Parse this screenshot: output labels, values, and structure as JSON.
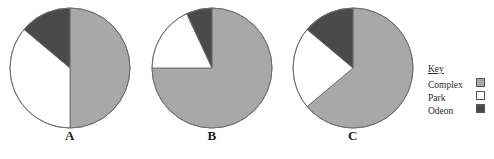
{
  "chart_data": {
    "type": "pie",
    "title": "",
    "legend_position": "right",
    "legend_title": "Key",
    "categories": [
      "Complex",
      "Park",
      "Odeon"
    ],
    "colors": [
      "#a8a8a8",
      "#ffffff",
      "#4a4a4a"
    ],
    "charts": [
      {
        "label": "A",
        "values": [
          50,
          36,
          14
        ],
        "slices": [
          {
            "name": "Complex",
            "percent": 50,
            "degrees": 180,
            "color": "#a8a8a8"
          },
          {
            "name": "Park",
            "percent": 36,
            "degrees": 130,
            "color": "#ffffff"
          },
          {
            "name": "Odeon",
            "percent": 14,
            "degrees": 50,
            "color": "#4a4a4a"
          }
        ]
      },
      {
        "label": "B",
        "values": [
          75,
          18,
          7
        ],
        "slices": [
          {
            "name": "Complex",
            "percent": 75,
            "degrees": 270,
            "color": "#a8a8a8"
          },
          {
            "name": "Park",
            "percent": 18,
            "degrees": 65,
            "color": "#ffffff"
          },
          {
            "name": "Odeon",
            "percent": 7,
            "degrees": 25,
            "color": "#4a4a4a"
          }
        ]
      },
      {
        "label": "C",
        "values": [
          64,
          22,
          14
        ],
        "slices": [
          {
            "name": "Complex",
            "percent": 64,
            "degrees": 230,
            "color": "#a8a8a8"
          },
          {
            "name": "Park",
            "percent": 22,
            "degrees": 80,
            "color": "#ffffff"
          },
          {
            "name": "Odeon",
            "percent": 14,
            "degrees": 50,
            "color": "#4a4a4a"
          }
        ]
      }
    ]
  },
  "legend": {
    "title": "Key",
    "items": [
      {
        "label": "Complex",
        "color": "#a8a8a8"
      },
      {
        "label": "Park",
        "color": "#ffffff"
      },
      {
        "label": "Odeon",
        "color": "#4a4a4a"
      }
    ]
  },
  "labels": {
    "a": "A",
    "b": "B",
    "c": "C"
  }
}
